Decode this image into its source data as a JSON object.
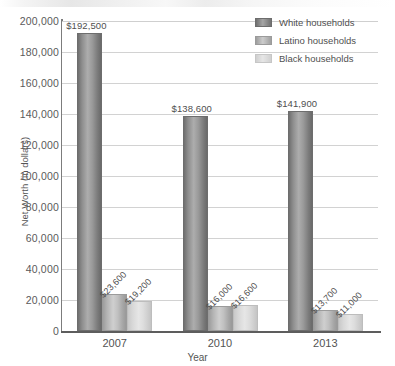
{
  "chart_data": {
    "type": "bar",
    "title": "",
    "xlabel": "Year",
    "ylabel": "Net Worth (in dollars)",
    "categories": [
      "2007",
      "2010",
      "2013"
    ],
    "series": [
      {
        "name": "White households",
        "color": "#8e8e8e",
        "values": [
          192500,
          138600,
          141900
        ],
        "labels": [
          "$192,500",
          "$138,600",
          "$141,900"
        ]
      },
      {
        "name": "Latino households",
        "color": "#bdbdbd",
        "values": [
          23600,
          16000,
          13700
        ],
        "labels": [
          "$23,600",
          "$16,000",
          "$13,700"
        ]
      },
      {
        "name": "Black households",
        "color": "#dedede",
        "values": [
          19200,
          16600,
          11000
        ],
        "labels": [
          "$19,200",
          "$16,600",
          "$11,000"
        ]
      }
    ],
    "ylim": [
      0,
      200000
    ],
    "ytick_values": [
      0,
      20000,
      40000,
      60000,
      80000,
      100000,
      120000,
      140000,
      160000,
      180000,
      200000
    ],
    "ytick_labels": [
      "0",
      "20,000",
      "40,000",
      "60,000",
      "80,000",
      "100,000",
      "120,000",
      "140,000",
      "160,000",
      "180,000",
      "200,000"
    ],
    "grid": true,
    "legend_position": "top-right"
  },
  "legend": {
    "entries": [
      {
        "label": "White households"
      },
      {
        "label": "Latino households"
      },
      {
        "label": "Black households"
      }
    ]
  }
}
